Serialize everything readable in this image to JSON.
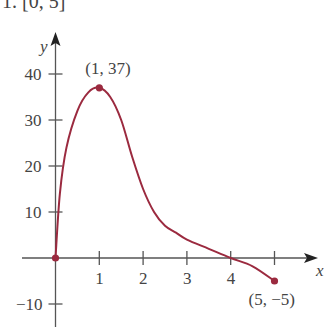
{
  "header": {
    "text": "1. [0, 5]"
  },
  "chart_data": {
    "type": "line",
    "title": "",
    "xlabel": "x",
    "ylabel": "y",
    "xlim": [
      -1,
      6
    ],
    "ylim": [
      -13,
      45
    ],
    "x_ticks": [
      1,
      2,
      3,
      4
    ],
    "x_tick_labels": [
      "1",
      "2",
      "3",
      "4"
    ],
    "y_ticks": [
      -10,
      10,
      20,
      30,
      40
    ],
    "y_tick_labels": [
      "−10",
      "10",
      "20",
      "30",
      "40"
    ],
    "grid": false,
    "series": [
      {
        "name": "f(x)",
        "color": "#9b2a3f",
        "x": [
          0,
          0.1,
          0.25,
          0.5,
          0.75,
          1,
          1.25,
          1.5,
          1.75,
          2,
          2.25,
          2.5,
          2.75,
          3,
          3.5,
          4,
          4.5,
          5
        ],
        "y": [
          0,
          14,
          24,
          32,
          36,
          37,
          35,
          30,
          22,
          15,
          10,
          7,
          5.5,
          4,
          2,
          0,
          -1.8,
          -5
        ]
      }
    ],
    "highlighted_points": [
      {
        "x": 0,
        "y": 0,
        "label": ""
      },
      {
        "x": 1,
        "y": 37,
        "label": "(1, 37)"
      },
      {
        "x": 5,
        "y": -5,
        "label": "(5, −5)"
      }
    ]
  },
  "colors": {
    "curve": "#9b2a3f",
    "axis": "#555555",
    "text": "#444444"
  }
}
